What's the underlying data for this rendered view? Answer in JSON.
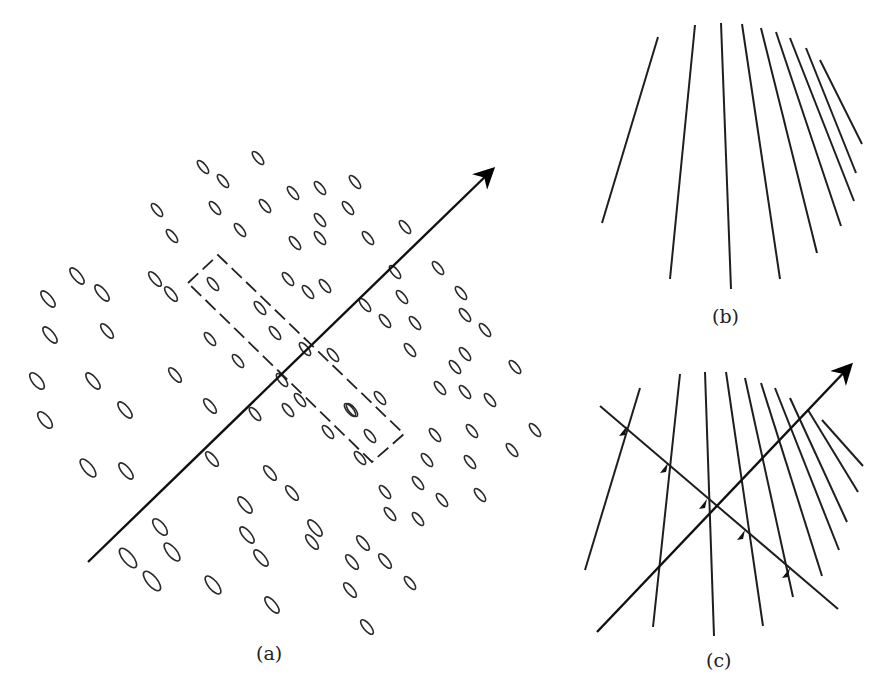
{
  "figure": {
    "panels": [
      {
        "id": "a",
        "label": "(a)",
        "description": "Field of oriented ellipses with a directed axis arrow and a dashed rectangular window"
      },
      {
        "id": "b",
        "label": "(b)",
        "description": "Fan of line segments converging upward"
      },
      {
        "id": "c",
        "label": "(c)",
        "description": "Fan of lines intersected by a directed axis arrow and a perpendicular line with arrow tick marks"
      }
    ]
  },
  "panel_a": {
    "label": "(a)",
    "axis": {
      "x1": 88,
      "y1": 562,
      "x2": 492,
      "y2": 170
    },
    "dashed_box": [
      [
        188,
        283
      ],
      [
        218,
        255
      ],
      [
        404,
        434
      ],
      [
        372,
        462
      ]
    ],
    "ellipses": [
      [
        258,
        158,
        8,
        3.2,
        -55
      ],
      [
        203,
        167,
        8,
        3.2,
        -50
      ],
      [
        223,
        181,
        8,
        3.2,
        -50
      ],
      [
        293,
        193,
        8,
        3.2,
        -50
      ],
      [
        320,
        188,
        8,
        3.2,
        -50
      ],
      [
        355,
        182,
        8,
        3.2,
        -50
      ],
      [
        157,
        210,
        8,
        3.2,
        -50
      ],
      [
        215,
        208,
        8,
        3.2,
        -50
      ],
      [
        265,
        206,
        8,
        3.2,
        -50
      ],
      [
        320,
        220,
        8,
        3.2,
        -50
      ],
      [
        348,
        208,
        8,
        3.2,
        -50
      ],
      [
        405,
        227,
        8,
        3.2,
        -50
      ],
      [
        172,
        236,
        8,
        3.2,
        -50
      ],
      [
        240,
        230,
        8,
        3.2,
        -50
      ],
      [
        295,
        243,
        8,
        3.2,
        -50
      ],
      [
        368,
        238,
        8,
        3.2,
        -50
      ],
      [
        320,
        238,
        8,
        3.2,
        -50
      ],
      [
        77,
        276,
        10,
        4,
        -50
      ],
      [
        102,
        293,
        10,
        4,
        -50
      ],
      [
        155,
        279,
        9,
        3.5,
        -50
      ],
      [
        171,
        294,
        9,
        3.5,
        -50
      ],
      [
        213,
        284,
        8,
        3.2,
        -50
      ],
      [
        288,
        279,
        8,
        3.2,
        -50
      ],
      [
        325,
        286,
        8,
        3.2,
        -50
      ],
      [
        395,
        272,
        8,
        3.2,
        -50
      ],
      [
        438,
        268,
        8,
        3.2,
        -50
      ],
      [
        48,
        299,
        10,
        4,
        -50
      ],
      [
        260,
        308,
        8,
        3.2,
        -50
      ],
      [
        308,
        292,
        8,
        3.2,
        -50
      ],
      [
        365,
        305,
        8,
        3.2,
        -50
      ],
      [
        402,
        297,
        8,
        3.2,
        -50
      ],
      [
        385,
        321,
        8,
        3.2,
        -50
      ],
      [
        461,
        293,
        8,
        3.2,
        -50
      ],
      [
        107,
        331,
        9,
        3.5,
        -50
      ],
      [
        50,
        335,
        10,
        4,
        -50
      ],
      [
        210,
        339,
        8,
        3.2,
        -50
      ],
      [
        275,
        333,
        8,
        3.2,
        -50
      ],
      [
        305,
        349,
        8,
        3.2,
        -50
      ],
      [
        415,
        323,
        8,
        3.2,
        -50
      ],
      [
        465,
        315,
        8,
        3.2,
        -50
      ],
      [
        485,
        330,
        8,
        3.2,
        -50
      ],
      [
        455,
        367,
        8,
        3.2,
        -50
      ],
      [
        37,
        381,
        10,
        4.5,
        -55
      ],
      [
        93,
        381,
        10,
        4,
        -50
      ],
      [
        175,
        375,
        9,
        3.5,
        -50
      ],
      [
        238,
        361,
        8,
        3.2,
        -50
      ],
      [
        282,
        380,
        8,
        3.2,
        -50
      ],
      [
        333,
        355,
        8,
        3.2,
        -50
      ],
      [
        410,
        350,
        8,
        3.2,
        -50
      ],
      [
        465,
        354,
        8,
        3.2,
        -50
      ],
      [
        515,
        367,
        8,
        3.2,
        -50
      ],
      [
        45,
        420,
        10,
        4.5,
        -55
      ],
      [
        125,
        410,
        10,
        4,
        -50
      ],
      [
        210,
        406,
        9,
        3.5,
        -50
      ],
      [
        255,
        414,
        8,
        3.2,
        -50
      ],
      [
        288,
        410,
        8,
        3.2,
        -50
      ],
      [
        350,
        410,
        8,
        3.2,
        -50
      ],
      [
        380,
        398,
        8,
        3.2,
        -50
      ],
      [
        440,
        388,
        8,
        3.2,
        -50
      ],
      [
        465,
        392,
        8,
        3.2,
        -50
      ],
      [
        490,
        400,
        8,
        3.2,
        -50
      ],
      [
        300,
        400,
        8,
        3.2,
        -50
      ],
      [
        352,
        410,
        8,
        3.2,
        -50
      ],
      [
        328,
        432,
        8,
        3.2,
        -50
      ],
      [
        370,
        436,
        8,
        3.2,
        -50
      ],
      [
        435,
        435,
        8,
        3.2,
        -50
      ],
      [
        472,
        431,
        8,
        3.2,
        -50
      ],
      [
        535,
        430,
        8,
        3.2,
        -50
      ],
      [
        88,
        468,
        11,
        4.5,
        -50
      ],
      [
        126,
        471,
        10,
        4,
        -50
      ],
      [
        212,
        459,
        9,
        3.5,
        -50
      ],
      [
        270,
        473,
        9,
        3.5,
        -50
      ],
      [
        360,
        458,
        8,
        3.2,
        -50
      ],
      [
        427,
        460,
        8,
        3.2,
        -50
      ],
      [
        470,
        462,
        8,
        3.2,
        -50
      ],
      [
        512,
        450,
        8,
        3.2,
        -50
      ],
      [
        245,
        505,
        10,
        4,
        -50
      ],
      [
        292,
        493,
        9,
        3.5,
        -50
      ],
      [
        385,
        492,
        8,
        3.2,
        -50
      ],
      [
        418,
        483,
        8,
        3.2,
        -50
      ],
      [
        442,
        500,
        8,
        3.2,
        -50
      ],
      [
        480,
        495,
        8,
        3.2,
        -50
      ],
      [
        160,
        527,
        10,
        4.5,
        -50
      ],
      [
        247,
        535,
        10,
        4,
        -50
      ],
      [
        315,
        528,
        10,
        4,
        -50
      ],
      [
        363,
        543,
        9,
        3.5,
        -50
      ],
      [
        390,
        514,
        8,
        3.2,
        -50
      ],
      [
        418,
        519,
        8,
        3.2,
        -50
      ],
      [
        128,
        558,
        12,
        5,
        -50
      ],
      [
        172,
        552,
        11,
        4.5,
        -50
      ],
      [
        261,
        558,
        10,
        4,
        -50
      ],
      [
        312,
        542,
        9,
        3.5,
        -50
      ],
      [
        352,
        562,
        9,
        3.5,
        -50
      ],
      [
        385,
        561,
        9,
        3.5,
        -50
      ],
      [
        410,
        583,
        8,
        3.2,
        -50
      ],
      [
        152,
        581,
        12,
        5,
        -50
      ],
      [
        213,
        585,
        11,
        4.5,
        -50
      ],
      [
        272,
        605,
        10,
        4,
        -50
      ],
      [
        350,
        590,
        9,
        3.5,
        -50
      ],
      [
        367,
        627,
        9,
        3.5,
        -50
      ]
    ]
  },
  "panel_b": {
    "label": "(b)",
    "lines": [
      [
        658,
        37,
        602,
        223
      ],
      [
        695,
        25,
        670,
        279
      ],
      [
        721,
        23,
        731,
        289
      ],
      [
        742,
        24,
        780,
        279
      ],
      [
        761,
        28,
        817,
        253
      ],
      [
        776,
        32,
        841,
        226
      ],
      [
        790,
        38,
        854,
        201
      ],
      [
        806,
        48,
        856,
        173
      ],
      [
        820,
        60,
        862,
        144
      ]
    ]
  },
  "panel_c": {
    "label": "(c)",
    "fan_lines": [
      [
        640,
        388,
        585,
        570
      ],
      [
        680,
        374,
        653,
        627
      ],
      [
        705,
        372,
        714,
        636
      ],
      [
        726,
        372,
        763,
        626
      ],
      [
        745,
        378,
        793,
        597
      ],
      [
        761,
        383,
        822,
        576
      ],
      [
        775,
        388,
        839,
        550
      ],
      [
        790,
        398,
        847,
        522
      ],
      [
        808,
        410,
        858,
        492
      ],
      [
        822,
        420,
        863,
        466
      ]
    ],
    "axis": {
      "x1": 597,
      "y1": 632,
      "x2": 850,
      "y2": 366
    },
    "cross_line": {
      "x1": 600,
      "y1": 406,
      "x2": 838,
      "y2": 609
    },
    "tick_marks": [
      [
        627,
        430
      ],
      [
        668,
        467
      ],
      [
        707,
        503
      ],
      [
        745,
        534
      ],
      [
        790,
        572
      ]
    ]
  }
}
